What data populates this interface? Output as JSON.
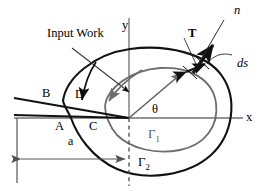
{
  "figure": {
    "title_text": "Input Work",
    "colors": {
      "stroke_dark": "#111111",
      "stroke_gray": "#6e6e6e",
      "axis_gray": "#707070",
      "background": "#ffffff"
    }
  },
  "axes": {
    "x_label": "x",
    "y_label": "y"
  },
  "labels": {
    "input_work": "Input Work",
    "point_a": "A",
    "point_b": "B",
    "point_c": "C",
    "point_d": "D",
    "theta": "θ",
    "traction": "T",
    "normal": "n",
    "arc_length": "ds",
    "dimension_a": "a",
    "gamma_1_base": "Γ",
    "gamma_1_sub": "1",
    "gamma_2_base": "Γ",
    "gamma_2_sub": "2"
  },
  "geometry": {
    "origin": {
      "x": 129,
      "y": 118
    },
    "outer_contour_name": "Γ2",
    "inner_contour_name": "Γ1"
  }
}
